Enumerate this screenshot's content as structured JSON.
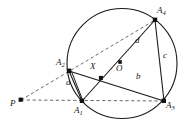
{
  "figure": {
    "kind": "geometry-diagram",
    "width": 186,
    "height": 136,
    "colors": {
      "background": "#ffffff",
      "stroke": "#1a1a1a",
      "dashed_stroke": "#555555",
      "label": "#1a1a1a"
    },
    "circle": {
      "name": "circumcircle",
      "cx": 122,
      "cy": 63.5,
      "r": 55
    },
    "points": [
      {
        "id": "P",
        "label": "P",
        "x": 21,
        "y": 100,
        "dot": true,
        "label_x": 10,
        "label_y": 99
      },
      {
        "id": "A1",
        "label": "A",
        "sub": "1",
        "x": 82,
        "y": 101,
        "dot": true,
        "label_x": 74,
        "label_y": 108
      },
      {
        "id": "A2",
        "label": "A",
        "sub": "2",
        "x": 69,
        "y": 71,
        "dot": true,
        "label_x": 56,
        "label_y": 60
      },
      {
        "id": "A3",
        "label": "A",
        "sub": "3",
        "x": 164,
        "y": 101,
        "dot": true,
        "label_x": 166,
        "label_y": 103
      },
      {
        "id": "A4",
        "label": "A",
        "sub": "4",
        "x": 155,
        "y": 20,
        "dot": true,
        "label_x": 157,
        "label_y": 8
      },
      {
        "id": "X",
        "label": "X",
        "x": 101,
        "y": 78,
        "dot": true,
        "label_x": 90,
        "label_y": 64
      },
      {
        "id": "O",
        "label": "O",
        "x": 120,
        "y": 62,
        "dot": true,
        "label_x": 116,
        "label_y": 66
      }
    ],
    "solid_segments": [
      {
        "name": "A2-A1",
        "from": "A2",
        "to": "A1"
      },
      {
        "name": "A2-A1-inner",
        "from": "A2",
        "to": "A1"
      },
      {
        "name": "A2-A3",
        "from": "A2",
        "to": "A3"
      },
      {
        "name": "A1-A4",
        "from": "A1",
        "to": "A4"
      },
      {
        "name": "A4-A3",
        "from": "A4",
        "to": "A3"
      }
    ],
    "dashed_segments": [
      {
        "name": "P-A1-A3",
        "from": "P",
        "to": "A3"
      },
      {
        "name": "P-A2-A4",
        "from": "P",
        "to": "A4"
      }
    ],
    "side_labels": [
      {
        "id": "a",
        "label": "a",
        "x": 68,
        "y": 81,
        "for": "A1-A2"
      },
      {
        "id": "b",
        "label": "b",
        "x": 137,
        "y": 75,
        "for": "A2-A3"
      },
      {
        "id": "c",
        "label": "c",
        "x": 164,
        "y": 54,
        "for": "A3-A4"
      },
      {
        "id": "d",
        "label": "d",
        "x": 136,
        "y": 39,
        "for": "A1-A4"
      }
    ]
  }
}
